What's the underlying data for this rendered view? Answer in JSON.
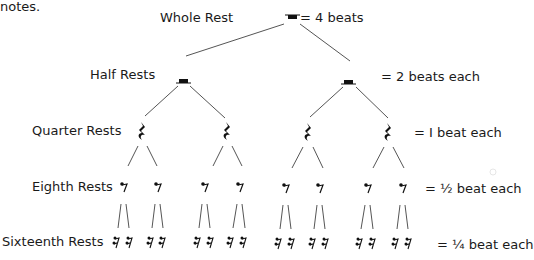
{
  "header_fragment": "notes.",
  "levels": [
    {
      "name": "Whole Rest",
      "value": "= 4 beats"
    },
    {
      "name": "Half Rests",
      "value": "= 2 beats each"
    },
    {
      "name": "Quarter Rests",
      "value": "= I beat  each"
    },
    {
      "name": "Eighth Rests",
      "value": "= ½ beat  each"
    },
    {
      "name": "Sixteenth Rests",
      "value": "= ¼ beat each"
    }
  ],
  "icons": {
    "whole": "whole-rest-icon",
    "half": "half-rest-icon",
    "quarter": "quarter-rest-icon",
    "eighth": "eighth-rest-icon",
    "sixteenth": "sixteenth-rest-icon"
  },
  "colors": {
    "line": "#555555",
    "symbol": "#111111",
    "text": "#1a1a1a"
  }
}
